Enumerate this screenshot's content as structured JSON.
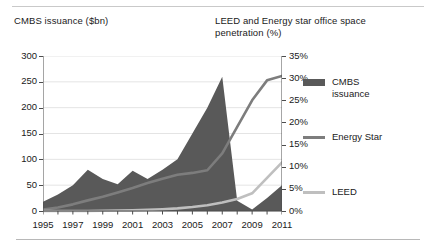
{
  "titles": {
    "left_axis_title": "CMBS issuance ($bn)",
    "right_axis_title": "LEED and Energy star office space penetration (%)"
  },
  "legend": {
    "items": [
      {
        "label": "CMBS\nissuance",
        "color": "#595959",
        "marker": "area-swatch"
      },
      {
        "label": "Energy Star",
        "color": "#7d7d7d",
        "marker": "line-swatch"
      },
      {
        "label": "LEED",
        "color": "#bfbfbf",
        "marker": "line-swatch"
      }
    ]
  },
  "axes": {
    "left_ticks": [
      "300",
      "250",
      "200",
      "150",
      "100",
      "50",
      "0"
    ],
    "right_ticks": [
      "35%",
      "30%",
      "25%",
      "20%",
      "15%",
      "10%",
      "5%",
      "0%"
    ],
    "x_ticks": [
      "1995",
      "1997",
      "1999",
      "2001",
      "2003",
      "2005",
      "2007",
      "2009",
      "2011"
    ]
  },
  "chart_data": {
    "type": "area",
    "title": "",
    "subtitle": "",
    "xlabel": "",
    "ylabel": "CMBS issuance ($bn)",
    "y2label": "LEED and Energy star office space penetration (%)",
    "grid": true,
    "legend_position": "right",
    "x": [
      1995,
      1996,
      1997,
      1998,
      1999,
      2000,
      2001,
      2002,
      2003,
      2004,
      2005,
      2006,
      2007,
      2008,
      2009,
      2010,
      2011
    ],
    "xlim": [
      1995,
      2011
    ],
    "ylim": [
      0,
      300
    ],
    "y2lim": [
      0,
      35
    ],
    "series": [
      {
        "name": "CMBS issuance",
        "type": "area",
        "axis": "left",
        "unit": "$bn",
        "color": "#595959",
        "values": [
          18,
          32,
          50,
          80,
          62,
          52,
          78,
          62,
          80,
          100,
          150,
          200,
          260,
          20,
          3,
          25,
          50
        ]
      },
      {
        "name": "Energy Star",
        "type": "line",
        "axis": "right",
        "unit": "%",
        "color": "#7d7d7d",
        "values": [
          0.3,
          0.8,
          1.5,
          2.4,
          3.2,
          4.2,
          5.2,
          6.3,
          7.3,
          8.2,
          8.6,
          9.2,
          13.0,
          19.0,
          25.0,
          29.5,
          30.5
        ]
      },
      {
        "name": "LEED",
        "type": "line",
        "axis": "right",
        "unit": "%",
        "color": "#bfbfbf",
        "values": [
          0.0,
          0.0,
          0.0,
          0.0,
          0.05,
          0.1,
          0.15,
          0.25,
          0.4,
          0.6,
          0.9,
          1.3,
          1.9,
          2.7,
          4.0,
          7.5,
          11.0
        ]
      }
    ]
  }
}
